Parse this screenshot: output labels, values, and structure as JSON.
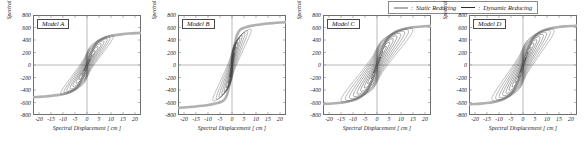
{
  "legend": {
    "items": [
      {
        "label": "Static Reducing",
        "style": "thick-gray",
        "color": "#b0b0b0",
        "separator": ":"
      },
      {
        "label": "Dynamic Reducing",
        "style": "thin-black",
        "color": "#2b2b2b",
        "separator": ":"
      }
    ]
  },
  "axes": {
    "xlabel": "Spectral Displacement [ cm ]",
    "ylabel_html": "Spectral Acceleration [ cm/sec",
    "ylabel_sup": "2",
    "ylabel_tail": " ]",
    "xticks": [
      -20,
      -15,
      -10,
      -5,
      0,
      5,
      10,
      15,
      20
    ],
    "xtick_labels": [
      "-20",
      "-15",
      "-10",
      "-5",
      "0",
      "5",
      "10",
      "15",
      "20"
    ],
    "yticks": [
      800,
      600,
      400,
      200,
      0,
      -200,
      -400,
      -600,
      -800
    ],
    "ytick_labels": [
      "800",
      "600",
      "400",
      "200",
      "0",
      "-200",
      "-400",
      "-600",
      "-800"
    ],
    "xlim": [
      -22.5,
      22.5
    ],
    "ylim": [
      -800,
      800
    ],
    "grid": false
  },
  "chart_data": [
    {
      "type": "line",
      "title": "Model A",
      "xlabel": "Spectral Displacement [ cm ]",
      "ylabel": "Spectral Acceleration [ cm/sec^2 ]",
      "xlim": [
        -22.5,
        22.5
      ],
      "ylim": [
        -800,
        800
      ],
      "grid": false,
      "series": [
        {
          "name": "Static Reducing",
          "kind": "backbone",
          "color": "#b0b0b0",
          "width": 2.6,
          "saturation": 500,
          "knee": 6.5,
          "x": [
            -22.5,
            -20,
            -17.5,
            -15,
            -12.5,
            -10,
            -8,
            -6,
            -4,
            -2,
            0,
            2,
            4,
            6,
            8,
            10,
            12.5,
            15,
            17.5,
            20,
            22.5
          ],
          "y": [
            -515,
            -510,
            -503,
            -494,
            -482,
            -463,
            -441,
            -409,
            -353,
            -213,
            0,
            213,
            353,
            409,
            441,
            463,
            482,
            494,
            503,
            510,
            515
          ]
        },
        {
          "name": "Dynamic Reducing",
          "kind": "hysteresis",
          "color": "#2b2b2b",
          "width": 0.55,
          "loop_count": 9,
          "max_displacement": 11.0,
          "max_acceleration": 470,
          "loops": [
            {
              "amp_x": 11.0,
              "amp_y": 455,
              "width": 0.46
            },
            {
              "amp_x": 9.6,
              "amp_y": 430,
              "width": 0.44
            },
            {
              "amp_x": 8.4,
              "amp_y": 405,
              "width": 0.42
            },
            {
              "amp_x": 7.1,
              "amp_y": 372,
              "width": 0.4
            },
            {
              "amp_x": 5.9,
              "amp_y": 333,
              "width": 0.37
            },
            {
              "amp_x": 4.6,
              "amp_y": 285,
              "width": 0.34
            },
            {
              "amp_x": 3.4,
              "amp_y": 228,
              "width": 0.3
            },
            {
              "amp_x": 2.2,
              "amp_y": 163,
              "width": 0.26
            },
            {
              "amp_x": 1.2,
              "amp_y": 96,
              "width": 0.22
            }
          ]
        }
      ]
    },
    {
      "type": "line",
      "title": "Model B",
      "xlabel": "Spectral Displacement [ cm ]",
      "ylabel": "Spectral Acceleration [ cm/sec^2 ]",
      "xlim": [
        -22.5,
        22.5
      ],
      "ylim": [
        -800,
        800
      ],
      "grid": false,
      "series": [
        {
          "name": "Static Reducing",
          "kind": "backbone",
          "color": "#b0b0b0",
          "width": 2.6,
          "saturation": 625,
          "knee": 3.4,
          "x": [
            -22.5,
            -20,
            -17.5,
            -15,
            -12.5,
            -10,
            -8,
            -6,
            -4.5,
            -3.2,
            -2,
            -1,
            0,
            1,
            2,
            3.2,
            4.5,
            6,
            8,
            10,
            12.5,
            15,
            17.5,
            20,
            22.5
          ],
          "y": [
            -686,
            -680,
            -672,
            -663,
            -652,
            -639,
            -626,
            -608,
            -588,
            -556,
            -470,
            -290,
            0,
            290,
            470,
            556,
            588,
            608,
            626,
            639,
            652,
            663,
            672,
            680,
            686
          ]
        },
        {
          "name": "Dynamic Reducing",
          "kind": "hysteresis",
          "color": "#2b2b2b",
          "width": 0.55,
          "loop_count": 8,
          "max_displacement": 8.0,
          "max_acceleration": 560,
          "loops": [
            {
              "amp_x": 8.0,
              "amp_y": 555,
              "width": 0.4
            },
            {
              "amp_x": 6.6,
              "amp_y": 535,
              "width": 0.38
            },
            {
              "amp_x": 5.4,
              "amp_y": 505,
              "width": 0.35
            },
            {
              "amp_x": 4.3,
              "amp_y": 470,
              "width": 0.32
            },
            {
              "amp_x": 3.3,
              "amp_y": 425,
              "width": 0.29
            },
            {
              "amp_x": 2.4,
              "amp_y": 363,
              "width": 0.25
            },
            {
              "amp_x": 1.6,
              "amp_y": 288,
              "width": 0.21
            },
            {
              "amp_x": 0.9,
              "amp_y": 190,
              "width": 0.17
            }
          ]
        }
      ]
    },
    {
      "type": "line",
      "title": "Model C",
      "xlabel": "Spectral Displacement [ cm ]",
      "ylabel": "Spectral Acceleration [ cm/sec^2 ]",
      "xlim": [
        -22.5,
        22.5
      ],
      "ylim": [
        -800,
        800
      ],
      "grid": false,
      "series": [
        {
          "name": "Static Reducing",
          "kind": "backbone",
          "color": "#b0b0b0",
          "width": 2.6,
          "saturation": 600,
          "knee": 8.5,
          "x": [
            -22.5,
            -20,
            -17.5,
            -15,
            -12.5,
            -10,
            -8,
            -6,
            -4,
            -2,
            0,
            2,
            4,
            6,
            8,
            10,
            12.5,
            15,
            17.5,
            20,
            22.5
          ],
          "y": [
            -625,
            -620,
            -613,
            -603,
            -589,
            -566,
            -536,
            -486,
            -400,
            -230,
            0,
            230,
            400,
            486,
            536,
            566,
            589,
            603,
            613,
            620,
            625
          ]
        },
        {
          "name": "Dynamic Reducing",
          "kind": "hysteresis",
          "color": "#2b2b2b",
          "width": 0.55,
          "loop_count": 10,
          "max_displacement": 15.0,
          "max_acceleration": 560,
          "loops": [
            {
              "amp_x": 15.0,
              "amp_y": 560,
              "width": 0.5
            },
            {
              "amp_x": 13.2,
              "amp_y": 540,
              "width": 0.48
            },
            {
              "amp_x": 11.5,
              "amp_y": 515,
              "width": 0.46
            },
            {
              "amp_x": 9.9,
              "amp_y": 485,
              "width": 0.44
            },
            {
              "amp_x": 8.3,
              "amp_y": 450,
              "width": 0.41
            },
            {
              "amp_x": 6.8,
              "amp_y": 408,
              "width": 0.38
            },
            {
              "amp_x": 5.3,
              "amp_y": 358,
              "width": 0.34
            },
            {
              "amp_x": 3.9,
              "amp_y": 297,
              "width": 0.3
            },
            {
              "amp_x": 2.5,
              "amp_y": 218,
              "width": 0.25
            },
            {
              "amp_x": 1.3,
              "amp_y": 126,
              "width": 0.2
            }
          ]
        }
      ]
    },
    {
      "type": "line",
      "title": "Model D",
      "xlabel": "Spectral Displacement [ cm ]",
      "ylabel": "Spectral Acceleration [ cm/sec^2 ]",
      "xlim": [
        -22.5,
        22.5
      ],
      "ylim": [
        -800,
        800
      ],
      "grid": false,
      "series": [
        {
          "name": "Static Reducing",
          "kind": "backbone",
          "color": "#b0b0b0",
          "width": 2.6,
          "saturation": 600,
          "knee": 7.5,
          "x": [
            -22.5,
            -20,
            -17.5,
            -15,
            -12.5,
            -10,
            -8,
            -6,
            -4,
            -2,
            0,
            2,
            4,
            6,
            8,
            10,
            12.5,
            15,
            17.5,
            20,
            22.5
          ],
          "y": [
            -630,
            -625,
            -618,
            -608,
            -594,
            -572,
            -545,
            -498,
            -415,
            -240,
            0,
            240,
            415,
            498,
            545,
            572,
            594,
            608,
            618,
            625,
            630
          ]
        },
        {
          "name": "Dynamic Reducing",
          "kind": "hysteresis",
          "color": "#2b2b2b",
          "width": 0.55,
          "loop_count": 10,
          "max_displacement": 13.0,
          "max_acceleration": 545,
          "loops": [
            {
              "amp_x": 13.0,
              "amp_y": 545,
              "width": 0.52
            },
            {
              "amp_x": 11.4,
              "amp_y": 525,
              "width": 0.5
            },
            {
              "amp_x": 9.9,
              "amp_y": 500,
              "width": 0.47
            },
            {
              "amp_x": 8.5,
              "amp_y": 470,
              "width": 0.45
            },
            {
              "amp_x": 7.1,
              "amp_y": 435,
              "width": 0.42
            },
            {
              "amp_x": 5.8,
              "amp_y": 393,
              "width": 0.38
            },
            {
              "amp_x": 4.5,
              "amp_y": 343,
              "width": 0.34
            },
            {
              "amp_x": 3.3,
              "amp_y": 283,
              "width": 0.3
            },
            {
              "amp_x": 2.1,
              "amp_y": 208,
              "width": 0.25
            },
            {
              "amp_x": 1.1,
              "amp_y": 118,
              "width": 0.2
            }
          ]
        }
      ]
    }
  ]
}
